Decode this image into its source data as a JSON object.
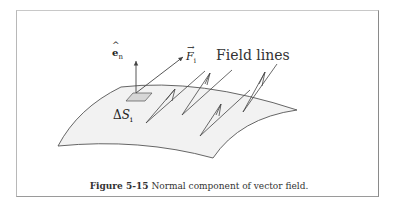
{
  "figure": {
    "number_label": "Figure 5-15",
    "caption_text": "Normal component of vector field.",
    "labels": {
      "normal_vector_symbol": "e",
      "normal_vector_hat": "^",
      "normal_vector_subscript": "n",
      "force_vector_symbol": "F",
      "force_vector_arrow": "→",
      "force_vector_subscript": "i",
      "field_lines": "Field lines",
      "surface_element_prefix": "Δ",
      "surface_element_symbol": "S",
      "surface_element_subscript": "i"
    },
    "colors": {
      "surface_fill": "#f2f2f2",
      "line": "#444444",
      "patch_fill": "#d8d8d8",
      "frame": "#a0a0a0"
    }
  }
}
